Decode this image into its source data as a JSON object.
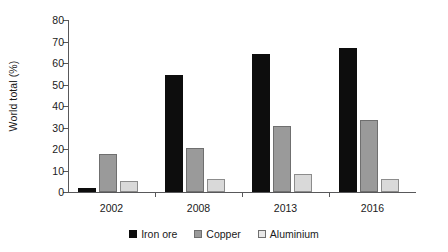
{
  "chart_data": {
    "type": "bar",
    "title": "",
    "subtitle": "",
    "xlabel": "",
    "ylabel": "World total (%)",
    "categories": [
      "2002",
      "2008",
      "2013",
      "2016"
    ],
    "series": [
      {
        "name": "Iron ore",
        "color": "#0d0d0d",
        "values": [
          1.7,
          54.5,
          64.0,
          67.0
        ]
      },
      {
        "name": "Copper",
        "color": "#9a9a9a",
        "values": [
          17.5,
          20.5,
          30.5,
          33.5
        ]
      },
      {
        "name": "Aluminium",
        "color": "#d9d9d9",
        "values": [
          5.0,
          6.0,
          8.5,
          6.0
        ]
      }
    ],
    "ylim": [
      0,
      80
    ],
    "yticks": [
      0,
      10,
      20,
      30,
      40,
      50,
      60,
      70,
      80
    ],
    "ytick_labels": [
      "0",
      "10",
      "20",
      "30",
      "40",
      "50",
      "60",
      "70",
      "80"
    ],
    "grid": false,
    "legend_position": "bottom",
    "legend_entries": [
      "Iron ore",
      "Copper",
      "Aluminium"
    ]
  },
  "legend": {
    "items": [
      {
        "label": "Iron ore"
      },
      {
        "label": "Copper"
      },
      {
        "label": "Aluminium"
      }
    ]
  },
  "axes": {
    "y_title": "World total (%)"
  }
}
